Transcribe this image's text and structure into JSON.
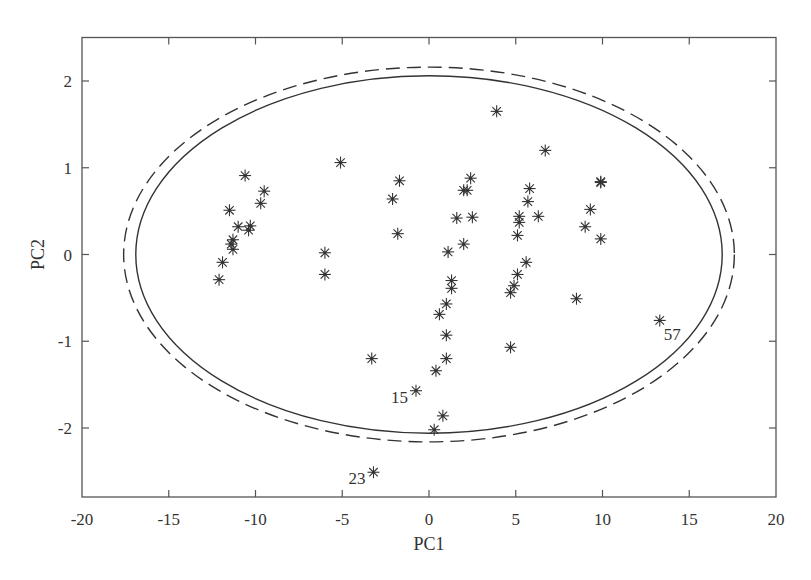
{
  "chart_data": {
    "type": "scatter",
    "title": "",
    "xlabel": "PC1",
    "ylabel": "PC2",
    "xlim": [
      -20,
      20
    ],
    "ylim": [
      -2.8,
      2.5
    ],
    "xticks": [
      -20,
      -15,
      -10,
      -5,
      0,
      5,
      10,
      15,
      20
    ],
    "yticks": [
      -2,
      -1,
      0,
      1,
      2
    ],
    "xtick_labels": [
      "-20",
      "-15",
      "-10",
      "-5",
      "0",
      "5",
      "10",
      "15",
      "20"
    ],
    "ytick_labels": [
      "-2",
      "-1",
      "0",
      "1",
      "2"
    ],
    "grid": false,
    "legend": null,
    "marker": "asterisk",
    "colors": {
      "axis": "#555555",
      "marker": "#333333",
      "ellipse": "#333333",
      "text": "#333333"
    },
    "ellipses": [
      {
        "name": "confidence-ellipse-inner",
        "style": "solid",
        "cx": 0,
        "cy": 0,
        "rx": 16.9,
        "ry": 2.06
      },
      {
        "name": "confidence-ellipse-outer",
        "style": "dashed",
        "cx": 0,
        "cy": 0,
        "rx": 17.6,
        "ry": 2.16
      }
    ],
    "series": [
      {
        "name": "samples",
        "points": [
          {
            "x": -10.6,
            "y": 0.91
          },
          {
            "x": -9.5,
            "y": 0.73
          },
          {
            "x": -9.7,
            "y": 0.59
          },
          {
            "x": -11.5,
            "y": 0.51
          },
          {
            "x": -11.0,
            "y": 0.32
          },
          {
            "x": -10.3,
            "y": 0.33
          },
          {
            "x": -10.4,
            "y": 0.28
          },
          {
            "x": -11.3,
            "y": 0.17
          },
          {
            "x": -11.4,
            "y": 0.12
          },
          {
            "x": -11.3,
            "y": 0.06
          },
          {
            "x": -11.9,
            "y": -0.09
          },
          {
            "x": -12.1,
            "y": -0.29
          },
          {
            "x": -5.1,
            "y": 1.06
          },
          {
            "x": -1.7,
            "y": 0.85
          },
          {
            "x": -2.1,
            "y": 0.64
          },
          {
            "x": -1.8,
            "y": 0.24
          },
          {
            "x": -6.0,
            "y": 0.02
          },
          {
            "x": -6.0,
            "y": -0.23
          },
          {
            "x": 2.4,
            "y": 0.88
          },
          {
            "x": 2.0,
            "y": 0.74
          },
          {
            "x": 2.2,
            "y": 0.74
          },
          {
            "x": 1.6,
            "y": 0.42
          },
          {
            "x": 2.5,
            "y": 0.43
          },
          {
            "x": 2.0,
            "y": 0.12
          },
          {
            "x": 1.1,
            "y": 0.03
          },
          {
            "x": 1.3,
            "y": -0.3
          },
          {
            "x": 1.3,
            "y": -0.39
          },
          {
            "x": 1.0,
            "y": -0.57
          },
          {
            "x": 0.6,
            "y": -0.69
          },
          {
            "x": 1.0,
            "y": -0.93
          },
          {
            "x": 1.0,
            "y": -1.2
          },
          {
            "x": 0.4,
            "y": -1.34
          },
          {
            "x": -0.75,
            "y": -1.57,
            "label": "15"
          },
          {
            "x": 0.8,
            "y": -1.86
          },
          {
            "x": 0.3,
            "y": -2.02
          },
          {
            "x": -3.3,
            "y": -1.2
          },
          {
            "x": -3.2,
            "y": -2.51,
            "label": "23"
          },
          {
            "x": 3.9,
            "y": 1.65
          },
          {
            "x": 6.7,
            "y": 1.2
          },
          {
            "x": 5.8,
            "y": 0.76
          },
          {
            "x": 5.7,
            "y": 0.61
          },
          {
            "x": 5.2,
            "y": 0.44
          },
          {
            "x": 6.3,
            "y": 0.44
          },
          {
            "x": 5.2,
            "y": 0.37
          },
          {
            "x": 5.1,
            "y": 0.22
          },
          {
            "x": 5.6,
            "y": -0.09
          },
          {
            "x": 5.1,
            "y": -0.23
          },
          {
            "x": 4.9,
            "y": -0.36
          },
          {
            "x": 4.7,
            "y": -0.44
          },
          {
            "x": 4.7,
            "y": -1.07
          },
          {
            "x": 9.9,
            "y": 0.83
          },
          {
            "x": 9.9,
            "y": 0.84
          },
          {
            "x": 9.3,
            "y": 0.52
          },
          {
            "x": 9.0,
            "y": 0.32
          },
          {
            "x": 9.9,
            "y": 0.18
          },
          {
            "x": 8.5,
            "y": -0.51
          },
          {
            "x": 13.3,
            "y": -0.76,
            "label": "57"
          }
        ]
      }
    ]
  }
}
